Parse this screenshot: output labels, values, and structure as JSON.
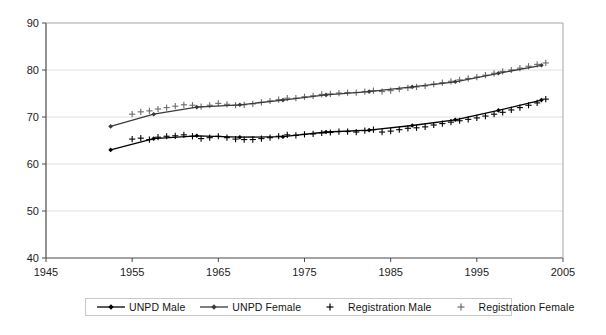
{
  "chart_data": {
    "type": "line",
    "title": "",
    "xlabel": "",
    "ylabel": "",
    "xlim": [
      1945,
      2005
    ],
    "ylim": [
      40,
      90
    ],
    "xticks": [
      1945,
      1955,
      1965,
      1975,
      1985,
      1995,
      2005
    ],
    "yticks": [
      40,
      50,
      60,
      70,
      80,
      90
    ],
    "grid": "horizontal",
    "legend_position": "bottom",
    "series": [
      {
        "name": "UNPD Male",
        "style": "line-with-diamond-markers",
        "color": "#000000",
        "x": [
          1952.5,
          1957.5,
          1962.5,
          1967.5,
          1972.5,
          1977.5,
          1982.5,
          1987.5,
          1992.5,
          1997.5,
          2002.5
        ],
        "values": [
          63.0,
          65.4,
          66.0,
          65.7,
          65.8,
          66.8,
          67.2,
          68.2,
          69.4,
          71.4,
          73.6
        ]
      },
      {
        "name": "UNPD Female",
        "style": "line-with-diamond-markers",
        "color": "#3a3a3a",
        "x": [
          1952.5,
          1957.5,
          1962.5,
          1967.5,
          1972.5,
          1977.5,
          1982.5,
          1987.5,
          1992.5,
          1997.5,
          2002.5
        ],
        "values": [
          68.0,
          70.6,
          72.1,
          72.6,
          73.6,
          74.7,
          75.4,
          76.4,
          77.5,
          79.3,
          81.0
        ]
      },
      {
        "name": "Registration Male",
        "style": "plus-markers",
        "color": "#000000",
        "x": [
          1955,
          1956,
          1957,
          1958,
          1959,
          1960,
          1961,
          1962,
          1963,
          1964,
          1965,
          1966,
          1967,
          1968,
          1969,
          1970,
          1971,
          1972,
          1973,
          1974,
          1975,
          1976,
          1977,
          1978,
          1979,
          1980,
          1981,
          1982,
          1983,
          1984,
          1985,
          1986,
          1987,
          1988,
          1989,
          1990,
          1991,
          1992,
          1993,
          1994,
          1995,
          1996,
          1997,
          1998,
          1999,
          2000,
          2001,
          2002,
          2003
        ],
        "values": [
          65.3,
          65.5,
          65.2,
          65.7,
          65.9,
          66.0,
          66.2,
          65.9,
          65.4,
          65.6,
          65.9,
          65.6,
          65.3,
          65.2,
          65.2,
          65.4,
          65.6,
          65.9,
          66.2,
          66.1,
          66.3,
          66.4,
          66.6,
          66.7,
          66.9,
          66.9,
          66.8,
          67.1,
          67.3,
          66.8,
          67.0,
          67.3,
          67.6,
          67.7,
          67.9,
          68.3,
          68.6,
          68.9,
          69.2,
          69.5,
          69.8,
          70.2,
          70.6,
          71.0,
          71.5,
          72.0,
          72.5,
          73.0,
          73.8
        ]
      },
      {
        "name": "Registration Female",
        "style": "plus-markers",
        "color": "#6b6b6b",
        "x": [
          1955,
          1956,
          1957,
          1958,
          1959,
          1960,
          1961,
          1962,
          1963,
          1964,
          1965,
          1966,
          1967,
          1968,
          1969,
          1970,
          1971,
          1972,
          1973,
          1974,
          1975,
          1976,
          1977,
          1978,
          1979,
          1980,
          1981,
          1982,
          1983,
          1984,
          1985,
          1986,
          1987,
          1988,
          1989,
          1990,
          1991,
          1992,
          1993,
          1994,
          1995,
          1996,
          1997,
          1998,
          1999,
          2000,
          2001,
          2002,
          2003
        ],
        "values": [
          70.6,
          71.1,
          71.3,
          71.7,
          72.0,
          72.3,
          72.6,
          72.5,
          72.2,
          72.5,
          72.9,
          72.7,
          72.5,
          72.6,
          72.8,
          73.1,
          73.4,
          73.7,
          74.0,
          74.0,
          74.3,
          74.5,
          74.8,
          74.9,
          75.1,
          75.2,
          75.2,
          75.4,
          75.6,
          75.4,
          75.6,
          75.9,
          76.2,
          76.4,
          76.6,
          77.0,
          77.3,
          77.6,
          77.9,
          78.2,
          78.5,
          78.9,
          79.3,
          79.7,
          80.0,
          80.4,
          80.8,
          81.2,
          81.5
        ]
      }
    ]
  },
  "legend": {
    "items": [
      {
        "label": "UNPD Male",
        "marker": "line-diamond",
        "color": "#000000"
      },
      {
        "label": "UNPD Female",
        "marker": "line-diamond",
        "color": "#3a3a3a"
      },
      {
        "label": "Registration Male",
        "marker": "plus",
        "color": "#000000"
      },
      {
        "label": "Registration Female",
        "marker": "plus",
        "color": "#6b6b6b"
      }
    ]
  },
  "axes": {
    "y_tick_labels": [
      "90",
      "80",
      "70",
      "60",
      "50",
      "40"
    ],
    "x_tick_labels": [
      "1945",
      "1955",
      "1965",
      "1975",
      "1985",
      "1995",
      "2005"
    ]
  }
}
